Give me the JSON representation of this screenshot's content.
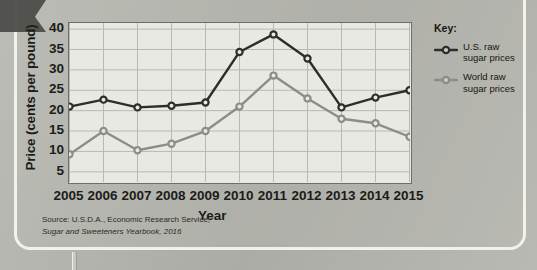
{
  "figure": {
    "corner_arrow_icon": "arrow-tab-icon",
    "source_note_line1": "Source: U.S.D.A., Economic Research Service,",
    "source_note_line2": "Sugar and Sweeteners Yearbook, 2016"
  },
  "legend": {
    "title": "Key:",
    "entries": [
      {
        "label_line1": "U.S. raw",
        "label_line2": "sugar prices",
        "color": "#2d2d2b",
        "marker_icon": "circle-marker-icon"
      },
      {
        "label_line1": "World raw",
        "label_line2": "sugar prices",
        "color": "#8c8c88",
        "marker_icon": "circle-marker-icon"
      }
    ]
  },
  "chart_data": {
    "type": "line",
    "title": "",
    "xlabel": "Year",
    "ylabel": "Price (cents per pound)",
    "categories": [
      "2005",
      "2006",
      "2007",
      "2008",
      "2009",
      "2010",
      "2011",
      "2012",
      "2013",
      "2014",
      "2015"
    ],
    "x": [
      2005,
      2006,
      2007,
      2008,
      2009,
      2010,
      2011,
      2012,
      2013,
      2014,
      2015
    ],
    "xlim": [
      2005,
      2015
    ],
    "ylim": [
      2.5,
      41.5
    ],
    "yticks": [
      5,
      10,
      15,
      20,
      25,
      30,
      35,
      40
    ],
    "ytick_labels": [
      "5",
      "10",
      "15",
      "20",
      "25",
      "30",
      "35",
      "40"
    ],
    "grid": true,
    "legend_position": "right",
    "series": [
      {
        "name": "U.S. raw sugar prices",
        "color": "#2d2d2b",
        "marker": "circle",
        "values": [
          21.0,
          22.7,
          20.8,
          21.2,
          22.0,
          34.4,
          38.7,
          32.8,
          20.8,
          23.2,
          25.0
        ]
      },
      {
        "name": "World raw sugar prices",
        "color": "#8c8c88",
        "marker": "circle",
        "values": [
          9.3,
          15.0,
          10.3,
          11.9,
          15.0,
          21.0,
          28.6,
          23.0,
          18.0,
          16.9,
          13.6
        ]
      }
    ]
  }
}
